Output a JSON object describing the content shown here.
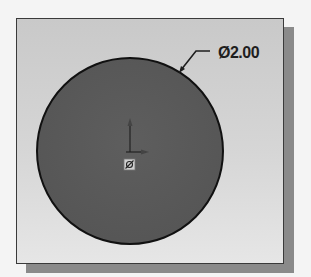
{
  "figure": {
    "type": "sketch-diagram"
  },
  "colors": {
    "background": "#f4f4f4",
    "frame_border": "#3a3a3a",
    "frame_fill_top": "#c9c9c9",
    "frame_fill_bottom": "#e6e6e6",
    "shadow": "#8a8a8a",
    "circle_fill": "#5a5a5a",
    "circle_stroke": "#111111",
    "leader": "#1e1e1e"
  },
  "circle": {
    "cx": 130,
    "cy": 151,
    "r": 93
  },
  "dimension": {
    "symbol": "Ø",
    "value": "2.00",
    "label": "Ø2.00"
  },
  "origin": {
    "x": 130,
    "y": 150,
    "label": "origin"
  }
}
